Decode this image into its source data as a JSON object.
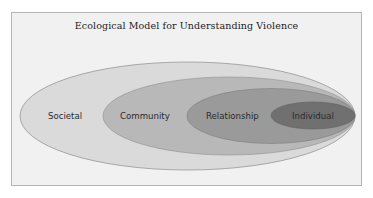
{
  "title": "Ecological Model for Understanding Violence",
  "levels": [
    {
      "label": "Societal",
      "color": "#dadada"
    },
    {
      "label": "Community",
      "color": "#b8b8b8"
    },
    {
      "label": "Relationship",
      "color": "#9a9a9a"
    },
    {
      "label": "Individual",
      "color": "#707070"
    }
  ]
}
